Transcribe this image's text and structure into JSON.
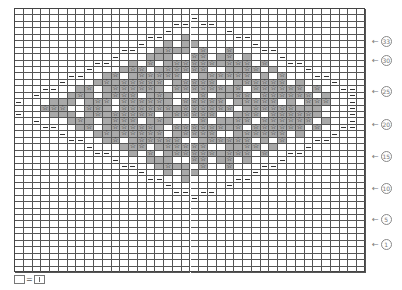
{
  "chart": {
    "columns": 40,
    "rows": 41,
    "symbols": {
      ".": "blank",
      "-": "purl-dash",
      "g": "gray",
      "s": "star-on-gray",
      "w": "star-on-white"
    },
    "grid": [
      "........................................",
      "....................-...................",
      "..................--.--.................",
      ".................-......-...............",
      "...............--..g.....--.............",
      "..............-..g.gg......-............",
      "............--..gsgg.s..s...--..........",
      "...........-...ggg..ss.gs.g...-.........",
      ".........--..g.s.gsssssgsss.s..--.......",
      "........-...gss.gsssss..ggss.g...-......",
      "......--..gs.gsssss..gsssss.g.s...--....",
      ".....-...gsgsssss.gssss..gsssss.g...-...",
      "...--..gs.gsssssg.ssssssgs.ssssss.s..--.",
      "..-...gsg.gsss.gsg...s.ggss.ssssss.g..-.",
      "-...ggg.gss.sssssg.sssss.gssss.g.sss..-.",
      "...sss..ssg.ssssssgssssss.gsssssggg...-.",
      "-...ggg.gsgsssss.gsssss..gss.sssssg...-.",
      "..-...gsg.gsss.gsg...s.ggss.ssssss.g..-.",
      "...--..gs.gsssssg.ssssssgs.ssssss.s..--.",
      ".....-...gsgsssss.gssss..gsssss.g...-...",
      "......--..gs.gsssss..gsssss.g.s...--....",
      "........-...gss.gsssss..ggss.g...-......",
      ".........--..g.s.gsssssgsss.s..--.......",
      "...........-...ggg..ss.gs.g...-.........",
      "............--..gsgg.s..s...--..........",
      "..............-..g.gg......-............",
      "...............--..g.....--.............",
      ".................-......-...............",
      "..................--.--.................",
      "....................-...................",
      "........................................",
      "........................................",
      "........................................",
      "........................................",
      "........................................",
      "........................................",
      "........................................",
      "........................................",
      "........................................",
      "........................................",
      "........................................"
    ]
  },
  "row_labels": [
    {
      "text": "33",
      "arrow": "←",
      "y": 36
    },
    {
      "text": "30",
      "arrow": "←",
      "y": 55
    },
    {
      "text": "25",
      "arrow": "←",
      "y": 86
    },
    {
      "text": "20",
      "arrow": "←",
      "y": 119
    },
    {
      "text": "15",
      "arrow": "←",
      "y": 151
    },
    {
      "text": "10",
      "arrow": "←",
      "y": 183
    },
    {
      "text": "5",
      "arrow": "←",
      "y": 214
    },
    {
      "text": "1",
      "arrow": "←",
      "y": 239
    }
  ],
  "legend": {
    "equals": "=",
    "description": "blank square equals knit stitch"
  }
}
